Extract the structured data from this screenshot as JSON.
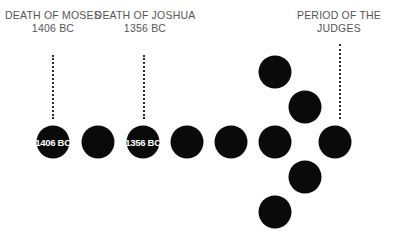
{
  "labels": {
    "moses": {
      "line1": "DEATH OF MOSES",
      "line2": "1406 BC"
    },
    "joshua": {
      "line1": "DEATH OF JOSHUA",
      "line2": "1356 BC"
    },
    "judges": {
      "line1": "PERIOD OF THE",
      "line2": "JUDGES"
    }
  },
  "circles": {
    "c1": "1406 BC",
    "c3": "1356 BC"
  },
  "colors": {
    "circle": "#0a0a0a",
    "text": "#555555",
    "circle_text": "#ffffff"
  }
}
